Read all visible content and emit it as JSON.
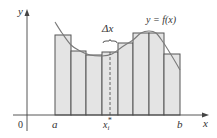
{
  "figure": {
    "width": 217,
    "height": 138,
    "colors": {
      "background": "#ffffff",
      "rect_fill": "#e4e4e4",
      "rect_stroke": "#555555",
      "curve": "#7a7a7a",
      "axis": "#444444",
      "text": "#333333"
    },
    "axes": {
      "origin": [
        27,
        115
      ],
      "x_axis_end": 209,
      "x_axis_start": 13,
      "y_axis_top": 9,
      "y_axis_bottom": 131
    },
    "labels": {
      "y_axis": "y",
      "x_axis": "x",
      "origin": "0",
      "a": "a",
      "b": "b",
      "sample_point": "x",
      "sample_point_sub": "i",
      "sample_point_sup": "*",
      "delta_x": "Δx",
      "function": "y = f(x)"
    },
    "label_positions": {
      "y_axis": [
        18,
        15
      ],
      "x_axis": [
        203,
        127
      ],
      "origin": [
        18,
        128
      ],
      "a": [
        52,
        128
      ],
      "b": [
        177,
        128
      ],
      "sample_point": [
        103,
        128
      ],
      "delta_x": [
        102,
        32
      ],
      "function": [
        146,
        23
      ]
    },
    "dashed_line_x": 110,
    "brace": {
      "x1": 103,
      "x2": 117,
      "y": 41
    }
  },
  "chart_data": {
    "type": "diagram",
    "interval": [
      "a",
      "b"
    ],
    "subintervals": 8,
    "edges_px": [
      55,
      71,
      86,
      102,
      118,
      133,
      149,
      164,
      180
    ],
    "rect_tops_px": [
      35,
      51,
      55,
      52,
      43,
      33,
      33,
      54
    ],
    "curve_points_px": [
      [
        55,
        22
      ],
      [
        62,
        33
      ],
      [
        71,
        45
      ],
      [
        80,
        51
      ],
      [
        90,
        55
      ],
      [
        102,
        56
      ],
      [
        112,
        54
      ],
      [
        122,
        47
      ],
      [
        133,
        40
      ],
      [
        141,
        33
      ],
      [
        149,
        31
      ],
      [
        156,
        33
      ],
      [
        163,
        42
      ],
      [
        170,
        53
      ],
      [
        176,
        63
      ],
      [
        180,
        70
      ]
    ],
    "annotations": [
      "y = f(x)",
      "Δx",
      "x_i*",
      "a",
      "b",
      "0",
      "x",
      "y"
    ]
  }
}
